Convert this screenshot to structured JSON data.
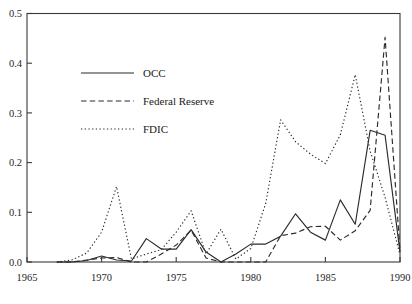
{
  "chart_data": {
    "type": "line",
    "title": "",
    "subtitle": "",
    "xlabel": "",
    "ylabel": "",
    "xlim": [
      1965,
      1990
    ],
    "ylim": [
      0.0,
      0.5
    ],
    "grid": false,
    "legend_position": "upper-left-inside",
    "x_ticks": [
      "1965",
      "1970",
      "1975",
      "1980",
      "1985",
      "1990"
    ],
    "x_tick_values": [
      1965,
      1970,
      1975,
      1980,
      1985,
      1990
    ],
    "y_ticks": [
      "0.0",
      "0.1",
      "0.2",
      "0.3",
      "0.4",
      "0.5"
    ],
    "y_tick_values": [
      0.0,
      0.1,
      0.2,
      0.3,
      0.4,
      0.5
    ],
    "x": [
      1967,
      1968,
      1969,
      1970,
      1971,
      1972,
      1973,
      1974,
      1975,
      1976,
      1977,
      1978,
      1979,
      1980,
      1981,
      1982,
      1983,
      1984,
      1985,
      1986,
      1987,
      1988,
      1989,
      1990
    ],
    "series": [
      {
        "name": "OCC",
        "style": "solid",
        "color": "#2b2b2b",
        "values": [
          0.0,
          0.0,
          0.003,
          0.012,
          0.004,
          0.002,
          0.047,
          0.026,
          0.026,
          0.065,
          0.02,
          0.0,
          0.016,
          0.036,
          0.036,
          0.052,
          0.097,
          0.06,
          0.044,
          0.125,
          0.076,
          0.265,
          0.255,
          0.02
        ]
      },
      {
        "name": "Federal Reserve",
        "style": "dashed",
        "color": "#2b2b2b",
        "values": [
          0.0,
          0.0,
          0.004,
          0.008,
          0.009,
          0.0,
          0.0,
          0.016,
          0.034,
          0.064,
          0.008,
          0.0,
          0.0,
          0.0,
          0.0,
          0.053,
          0.058,
          0.071,
          0.072,
          0.044,
          0.063,
          0.104,
          0.452,
          0.022
        ]
      },
      {
        "name": "FDIC",
        "style": "dotted",
        "color": "#2b2b2b",
        "values": [
          0.0,
          0.004,
          0.018,
          0.06,
          0.152,
          0.006,
          0.016,
          0.025,
          0.06,
          0.103,
          0.016,
          0.066,
          0.006,
          0.027,
          0.118,
          0.286,
          0.242,
          0.217,
          0.198,
          0.256,
          0.377,
          0.223,
          0.13,
          0.015
        ]
      }
    ],
    "legend": [
      {
        "label": "OCC",
        "style": "solid"
      },
      {
        "label": "Federal Reserve",
        "style": "dashed"
      },
      {
        "label": "FDIC",
        "style": "dotted"
      }
    ]
  }
}
